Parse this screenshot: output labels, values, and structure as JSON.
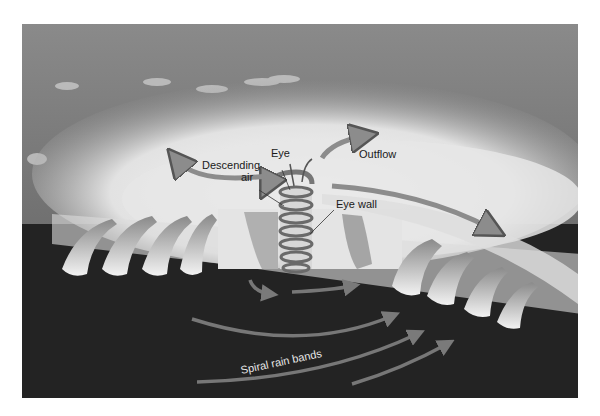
{
  "figure": {
    "labels": {
      "eye": "Eye",
      "descending_air_line1": "Descending",
      "descending_air_line2": "air",
      "outflow": "Outflow",
      "eye_wall": "Eye wall",
      "spiral_rain_bands": "Spiral rain bands"
    },
    "colors": {
      "background": "#ffffff",
      "sky_top": "#8a8a8a",
      "sky_bottom": "#5e5e5e",
      "cloud": "#eeeeee",
      "ground": "#232323",
      "arrow_fill": "#8c8c8c",
      "arrow_stroke": "#555555",
      "spiral": "#6a6a6a"
    }
  }
}
